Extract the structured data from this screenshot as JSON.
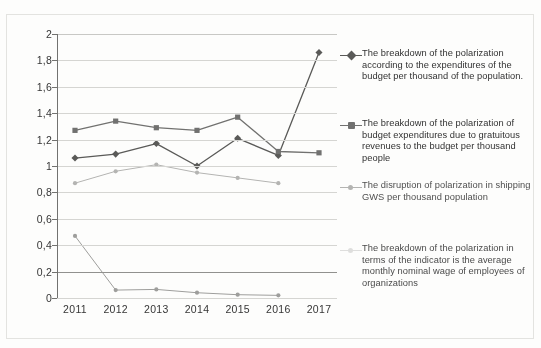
{
  "chart_data": {
    "type": "line",
    "title": "",
    "subtitle": "",
    "xlabel": "",
    "ylabel": "",
    "x": [
      "2011",
      "2012",
      "2013",
      "2014",
      "2015",
      "2016",
      "2017"
    ],
    "categories": [
      "2011",
      "2012",
      "2013",
      "2014",
      "2015",
      "2016",
      "2017"
    ],
    "ylim": [
      0,
      2
    ],
    "ytick_labels": [
      "0",
      "0,2",
      "0,4",
      "0,6",
      "0,8",
      "1",
      "1,2",
      "1,4",
      "1,6",
      "1,8",
      "2"
    ],
    "ytick_values": [
      0,
      0.2,
      0.4,
      0.6,
      0.8,
      1.0,
      1.2,
      1.4,
      1.6,
      1.8,
      2.0
    ],
    "ytick_step": 0.2,
    "grid": true,
    "grid_emphasis_at": 0.2,
    "legend_position": "right",
    "decimal_separator": ",",
    "series": [
      {
        "name": "series-budget-expenditures",
        "label": "The breakdown of the polarization according to the expenditures of the budget per thousand of the population.",
        "marker": "diamond",
        "color": "#555553",
        "values": [
          1.06,
          1.09,
          1.17,
          1.0,
          1.21,
          1.08,
          1.86
        ]
      },
      {
        "name": "series-gratuitous-revenues",
        "label": "The breakdown of the polarization of budget expenditures due to gratuitous revenues to the budget per thousand people",
        "marker": "square",
        "color": "#6e6e6c",
        "values": [
          1.27,
          1.34,
          1.29,
          1.27,
          1.37,
          1.11,
          1.1
        ]
      },
      {
        "name": "series-shipping-gws",
        "label": "The disruption of polarization in shipping GWS per thousand population",
        "marker": "dot-small",
        "color": "#b4b4b2",
        "values": [
          0.87,
          0.96,
          1.01,
          0.95,
          0.91,
          0.87,
          null
        ]
      },
      {
        "name": "series-nominal-wage",
        "label": "The breakdown of the polarization in terms of the indicator is the average monthly nominal wage of employees of organizations",
        "marker": "dot-small",
        "color": "#9d9d9b",
        "values": [
          0.47,
          0.06,
          0.065,
          0.04,
          0.025,
          0.02,
          null
        ]
      }
    ]
  }
}
